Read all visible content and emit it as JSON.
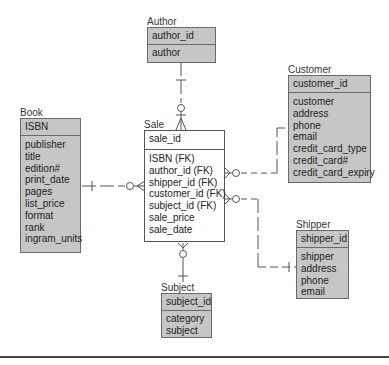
{
  "diagram": {
    "type": "entity-relationship",
    "entities": [
      {
        "name": "Author",
        "pk": "author_id",
        "attributes": [
          "author"
        ]
      },
      {
        "name": "Book",
        "pk": "ISBN",
        "attributes": [
          "publisher",
          "title",
          "edition#",
          "print_date",
          "pages",
          "list_price",
          "format",
          "rank",
          "ingram_units"
        ]
      },
      {
        "name": "Sale",
        "pk": "sale_id",
        "attributes": [
          "ISBN (FK)",
          "author_id (FK)",
          "shipper_id (FK)",
          "customer_id (FK)",
          "subject_id (FK)",
          "sale_price",
          "sale_date"
        ]
      },
      {
        "name": "Customer",
        "pk": "customer_id",
        "attributes": [
          "customer",
          "address",
          "phone",
          "email",
          "credit_card_type",
          "credit_card#",
          "credit_card_expiry"
        ]
      },
      {
        "name": "Shipper",
        "pk": "shipper_id",
        "attributes": [
          "shipper",
          "address",
          "phone",
          "email"
        ]
      },
      {
        "name": "Subject",
        "pk": "subject_id",
        "attributes": [
          "category",
          "subject"
        ]
      }
    ],
    "relationships": [
      {
        "from": "Author",
        "to": "Sale",
        "from_card": "one",
        "to_card": "zero-or-many"
      },
      {
        "from": "Book",
        "to": "Sale",
        "from_card": "one",
        "to_card": "zero-or-many"
      },
      {
        "from": "Customer",
        "to": "Sale",
        "from_card": "one",
        "to_card": "zero-or-many"
      },
      {
        "from": "Shipper",
        "to": "Sale",
        "from_card": "one",
        "to_card": "zero-or-many"
      },
      {
        "from": "Subject",
        "to": "Sale",
        "from_card": "one",
        "to_card": "zero-or-many"
      }
    ]
  },
  "colors": {
    "entity_fill": "#c6c6c6",
    "sale_fill": "#ffffff",
    "line": "#555555"
  }
}
